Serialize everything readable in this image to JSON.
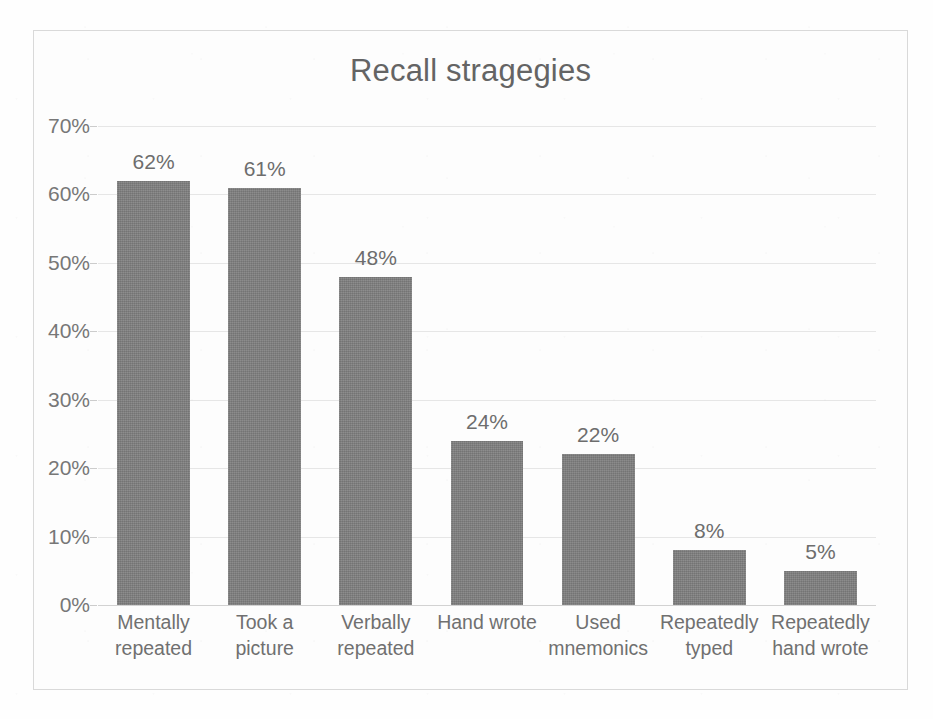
{
  "chart_data": {
    "type": "bar",
    "title": "Recall stragegies",
    "xlabel": "",
    "ylabel": "",
    "ylim": [
      0,
      70
    ],
    "ytick_labels": [
      "70%",
      "60%",
      "50%",
      "40%",
      "30%",
      "20%",
      "10%",
      "0%"
    ],
    "ytick_values": [
      70,
      60,
      50,
      40,
      30,
      20,
      10,
      0
    ],
    "grid": true,
    "legend": false,
    "bar_color": "#7f7f7f",
    "categories": [
      "Mentally repeated",
      "Took a picture",
      "Verbally repeated",
      "Hand wrote",
      "Used mnemonics",
      "Repeatedly typed",
      "Repeatedly hand wrote"
    ],
    "category_lines": [
      [
        "Mentally",
        "repeated"
      ],
      [
        "Took a",
        "picture"
      ],
      [
        "Verbally",
        "repeated"
      ],
      [
        "Hand wrote",
        ""
      ],
      [
        "Used",
        "mnemonics"
      ],
      [
        "Repeatedly",
        "typed"
      ],
      [
        "Repeatedly",
        "hand wrote"
      ]
    ],
    "values": [
      62,
      61,
      48,
      24,
      22,
      8,
      5
    ],
    "data_labels": [
      "62%",
      "61%",
      "48%",
      "24%",
      "22%",
      "8%",
      "5%"
    ]
  }
}
